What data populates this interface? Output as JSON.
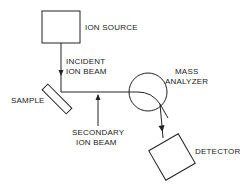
{
  "diagram": {
    "title": "",
    "labels": {
      "ion_source": "ION SOURCE",
      "incident_beam_line1": "INCIDENT",
      "incident_beam_line2": "ION BEAM",
      "sample": "SAMPLE",
      "mass_line1": "MASS",
      "mass_line2": "ANALYZER",
      "secondary_line1": "SECONDARY",
      "secondary_line2": "ION BEAM",
      "detector": "DETECTOR"
    },
    "colors": {
      "line": "#222222",
      "background": "#ffffff"
    }
  }
}
